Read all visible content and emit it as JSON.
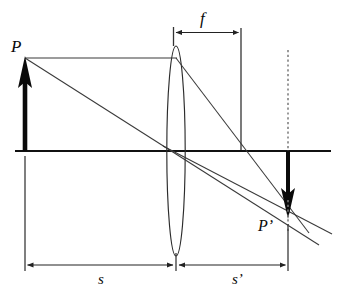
{
  "figure": {
    "type": "optics-ray-diagram",
    "colors": {
      "ink": "#111111",
      "ray": "#444444",
      "axis": "#111111",
      "dimension": "#333333",
      "dashed": "#666666",
      "background": "#ffffff"
    }
  },
  "labels": {
    "object_point": "P",
    "image_point": "P’",
    "focal_length": "f",
    "object_distance": "s",
    "image_distance": "s’"
  },
  "geometry": {
    "optical_axis": {
      "y": 151,
      "x_start": 15,
      "x_end": 331
    },
    "lens": {
      "cx": 176,
      "cy": 151,
      "rx": 9,
      "ry": 105,
      "top_y": 46,
      "bottom_y": 256
    },
    "object_arrow": {
      "x": 25,
      "base_y": 151,
      "tip_y": 58,
      "direction": "up"
    },
    "image_arrow": {
      "x": 288,
      "base_y": 151,
      "tip_y": 217,
      "direction": "down"
    },
    "object_point": {
      "x": 25,
      "y": 58
    },
    "image_point": {
      "x": 288,
      "y": 217
    },
    "focal_point_right": {
      "x": 241,
      "y": 151
    },
    "dashed_vertical": {
      "x": 288,
      "y_top": 50,
      "y_bottom": 151
    },
    "focal_vertical": {
      "x": 241,
      "y_top": 32,
      "y_bottom": 150
    },
    "lens_vertical_marker": {
      "x": 173,
      "y_top": 28,
      "y_bottom": 46
    }
  },
  "rays": [
    {
      "name": "parallel-incident-ray",
      "x1": 25,
      "y1": 58,
      "x2": 176,
      "y2": 58
    },
    {
      "name": "refracted-ray-through-focus",
      "x1": 176,
      "y1": 58,
      "x2": 308,
      "y2": 232
    },
    {
      "name": "chief-ray-through-center",
      "x1": 25,
      "y1": 58,
      "x2": 318,
      "y2": 243
    },
    {
      "name": "lower-ray-from-lens-bottom",
      "x1": 166,
      "y1": 148,
      "x2": 330,
      "y2": 233
    }
  ],
  "dimensions": {
    "focal": {
      "label": "f",
      "y": 32,
      "x_start": 174,
      "x_end": 241,
      "arrowheads": "both"
    },
    "baseline": {
      "y": 265,
      "object": {
        "label": "s",
        "x_start": 25,
        "x_end": 175,
        "arrowheads": "both"
      },
      "image": {
        "label": "s’",
        "x_start": 178,
        "x_end": 288,
        "arrowheads": "both"
      }
    },
    "extension_lines": [
      {
        "name": "left-extension",
        "x": 25,
        "y_top": 155,
        "y_bottom": 270
      },
      {
        "name": "center-extension",
        "x": 176,
        "y_top": 256,
        "y_bottom": 270
      },
      {
        "name": "right-extension",
        "x": 288,
        "y_top": 222,
        "y_bottom": 270
      }
    ]
  }
}
